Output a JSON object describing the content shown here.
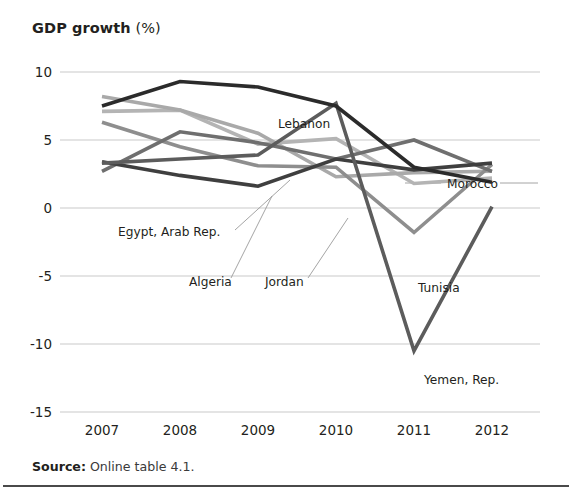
{
  "figure": {
    "title_bold": "GDP growth",
    "title_regular": " (%)",
    "source_bold": "Source:",
    "source_regular": " Online table 4.1."
  },
  "chart_data": {
    "type": "line",
    "title": "GDP growth (%)",
    "xlabel": "",
    "ylabel": "GDP growth (%)",
    "x": [
      "2007",
      "2008",
      "2009",
      "2010",
      "2011",
      "2012"
    ],
    "xtick_labels": [
      "2007",
      "2008",
      "2009",
      "2010",
      "2011",
      "2012"
    ],
    "ytick_labels": [
      "10",
      "5",
      "0",
      "-5",
      "-10",
      "-15"
    ],
    "ytick_values": [
      10,
      5,
      0,
      -5,
      -10,
      -15
    ],
    "ylim": [
      -15,
      10
    ],
    "grid": "horizontal",
    "legend": "inline-annotations",
    "series": [
      {
        "name": "Lebanon",
        "color": "#2b2b2b",
        "width": 3.6,
        "values": [
          7.5,
          9.3,
          8.9,
          7.5,
          3.0,
          1.9
        ],
        "label": {
          "text": "Lebanon",
          "x": 278,
          "y": 78,
          "anchor": "start",
          "leader": false
        }
      },
      {
        "name": "Yemen, Rep.",
        "color": "#5c5c5c",
        "width": 3.6,
        "values": [
          3.3,
          3.6,
          3.9,
          7.7,
          -10.5,
          0.1
        ],
        "label": {
          "text": "Yemen, Rep.",
          "x": 424,
          "y": 334,
          "anchor": "start",
          "leader": false
        }
      },
      {
        "name": "Tunisia",
        "color": "#8e8e8e",
        "width": 3.6,
        "values": [
          6.3,
          4.5,
          3.1,
          3.0,
          -1.8,
          3.2
        ],
        "label": {
          "text": "Tunisia",
          "x": 418,
          "y": 242,
          "anchor": "start",
          "leader": false
        }
      },
      {
        "name": "Morocco",
        "color": "#6f6f6f",
        "width": 3.6,
        "values": [
          2.7,
          5.6,
          4.8,
          3.6,
          5.0,
          2.7
        ],
        "label": {
          "text": "Morocco",
          "x": 447,
          "y": 138,
          "anchor": "start",
          "leader": true
        }
      },
      {
        "name": "Egypt, Arab Rep.",
        "color": "#b4b4b4",
        "width": 3.6,
        "values": [
          7.1,
          7.2,
          4.7,
          5.1,
          1.8,
          2.2
        ],
        "label": {
          "text": "Egypt, Arab Rep.",
          "x": 118,
          "y": 186,
          "anchor": "start",
          "leader": true
        }
      },
      {
        "name": "Algeria",
        "color": "#3f3f3f",
        "width": 3.6,
        "values": [
          3.4,
          2.4,
          1.6,
          3.6,
          2.8,
          3.3
        ],
        "label": {
          "text": "Algeria",
          "x": 189,
          "y": 236,
          "anchor": "start",
          "leader": true
        }
      },
      {
        "name": "Jordan",
        "color": "#a9a9a9",
        "width": 3.6,
        "values": [
          8.2,
          7.2,
          5.5,
          2.3,
          2.6,
          2.7
        ],
        "label": {
          "text": "Jordan",
          "x": 265,
          "y": 236,
          "anchor": "start",
          "leader": true
        }
      }
    ]
  }
}
